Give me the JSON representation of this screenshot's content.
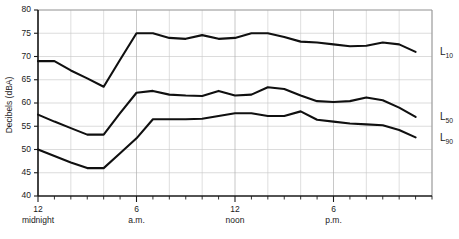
{
  "chart_data": {
    "type": "line",
    "title": "",
    "xlabel": "",
    "ylabel": "Decibels (dBA)",
    "ylim": [
      40,
      80
    ],
    "xlim": [
      0,
      24
    ],
    "grid": true,
    "legend_position": "right-inline",
    "y_ticks": [
      40,
      45,
      50,
      55,
      60,
      65,
      70,
      75,
      80
    ],
    "y_tick_labels": [
      "40",
      "45",
      "50",
      "55",
      "60",
      "65",
      "70",
      "75",
      "80"
    ],
    "x_major_ticks": [
      0,
      6,
      12,
      18
    ],
    "x_tick_labels": [
      "12",
      "6",
      "12",
      "6"
    ],
    "x_tick_sublabels": [
      "midnight",
      "a.m.",
      "noon",
      "p.m."
    ],
    "x_minor_tick_interval_hours": 1,
    "x_gridline_interval_hours": 2,
    "x": [
      0,
      1,
      2,
      3,
      4,
      5,
      6,
      7,
      8,
      9,
      10,
      11,
      12,
      13,
      14,
      15,
      16,
      17,
      18,
      19,
      20,
      21,
      22,
      23
    ],
    "series": [
      {
        "name": "L10",
        "label_base": "L",
        "label_sub": "10",
        "color": "#101010",
        "values": [
          69.0,
          69.0,
          67.0,
          65.3,
          63.5,
          69.3,
          75.0,
          75.0,
          74.0,
          73.8,
          74.6,
          73.8,
          74.0,
          75.0,
          75.0,
          74.2,
          73.2,
          73.0,
          72.6,
          72.2,
          72.3,
          73.0,
          72.6,
          71.0
        ]
      },
      {
        "name": "L50",
        "label_base": "L",
        "label_sub": "50",
        "color": "#101010",
        "values": [
          57.5,
          56.0,
          54.6,
          53.2,
          53.2,
          57.8,
          62.2,
          62.6,
          61.8,
          61.6,
          61.5,
          62.6,
          61.6,
          61.8,
          63.4,
          63.0,
          61.6,
          60.4,
          60.2,
          60.4,
          61.2,
          60.6,
          59.0,
          57.0
        ]
      },
      {
        "name": "L90",
        "label_base": "L",
        "label_sub": "90",
        "color": "#101010",
        "values": [
          50.0,
          48.6,
          47.2,
          46.0,
          46.0,
          49.2,
          52.4,
          56.5,
          56.5,
          56.5,
          56.6,
          57.2,
          57.8,
          57.8,
          57.2,
          57.2,
          58.2,
          56.4,
          56.0,
          55.6,
          55.4,
          55.2,
          54.2,
          52.6
        ]
      }
    ]
  }
}
